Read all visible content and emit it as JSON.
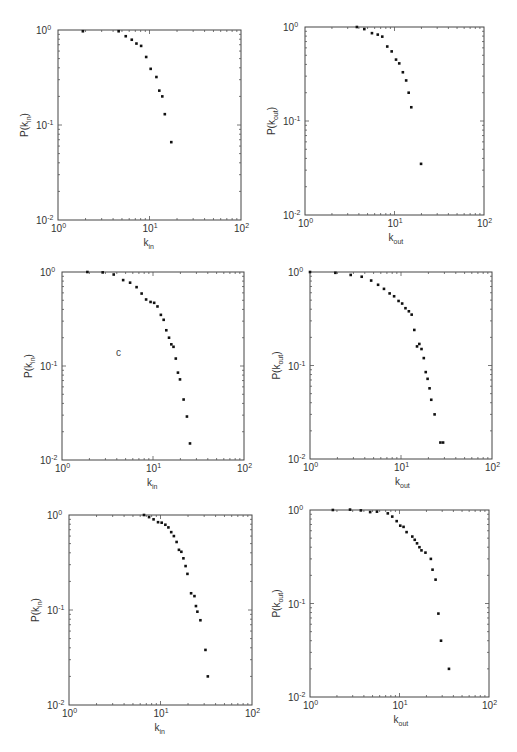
{
  "chart_data": [
    {
      "type": "scatter",
      "panel": "top-left",
      "xlabel": "k_in",
      "ylabel": "P(k_in)",
      "xscale": "log",
      "yscale": "log",
      "xlim": [
        1,
        100
      ],
      "ylim": [
        0.01,
        1
      ],
      "xticklabels": [
        "10^0",
        "10^1",
        "10^2"
      ],
      "yticklabels": [
        "10^-2",
        "10^-1",
        "10^0"
      ],
      "grid": false,
      "x": [
        1.87,
        4.6,
        5.5,
        6.4,
        7.2,
        8.1,
        9.2,
        10.3,
        11.9,
        12.8,
        13.8,
        14.7,
        17.3
      ],
      "y": [
        0.97,
        0.97,
        0.86,
        0.79,
        0.72,
        0.68,
        0.52,
        0.39,
        0.32,
        0.23,
        0.2,
        0.13,
        0.066
      ]
    },
    {
      "type": "scatter",
      "panel": "top-right",
      "xlabel": "k_out",
      "ylabel": "P(k_out)",
      "xscale": "log",
      "yscale": "log",
      "xlim": [
        1,
        100
      ],
      "ylim": [
        0.01,
        1
      ],
      "xticklabels": [
        "10^0",
        "10^1",
        "10^2"
      ],
      "yticklabels": [
        "10^-2",
        "10^-1",
        "10^0"
      ],
      "grid": false,
      "x": [
        3.8,
        4.6,
        5.6,
        6.5,
        7.3,
        8.3,
        9.3,
        10.4,
        11.3,
        12.4,
        13.5,
        14.4,
        15.4,
        19.8
      ],
      "y": [
        1.0,
        0.95,
        0.86,
        0.83,
        0.79,
        0.62,
        0.55,
        0.45,
        0.41,
        0.33,
        0.27,
        0.2,
        0.14,
        0.035
      ]
    },
    {
      "type": "scatter",
      "panel": "middle-left",
      "xlabel": "k_in",
      "ylabel": "P(k_in)",
      "xscale": "log",
      "yscale": "log",
      "xlim": [
        1,
        100
      ],
      "ylim": [
        0.01,
        1
      ],
      "xticklabels": [
        "10^0",
        "10^1",
        "10^2"
      ],
      "yticklabels": [
        "10^-2",
        "10^-1",
        "10^0"
      ],
      "grid": false,
      "annotation": "c",
      "x": [
        1.9,
        2.8,
        3.7,
        4.7,
        5.6,
        6.6,
        7.5,
        8.4,
        9.4,
        10.3,
        11.2,
        12.2,
        13.1,
        14.0,
        15.0,
        15.9,
        16.8,
        17.8,
        18.8,
        19.8,
        21.7,
        23.6,
        25.5
      ],
      "y": [
        1.0,
        0.99,
        0.94,
        0.82,
        0.77,
        0.69,
        0.59,
        0.51,
        0.48,
        0.47,
        0.43,
        0.35,
        0.31,
        0.24,
        0.2,
        0.17,
        0.16,
        0.12,
        0.085,
        0.072,
        0.044,
        0.029,
        0.015
      ]
    },
    {
      "type": "scatter",
      "panel": "middle-right",
      "xlabel": "k_out",
      "ylabel": "P(k_out)",
      "xscale": "log",
      "yscale": "log",
      "xlim": [
        1,
        100
      ],
      "ylim": [
        0.01,
        1
      ],
      "xticklabels": [
        "10^0",
        "10^1",
        "10^2"
      ],
      "yticklabels": [
        "10^-2",
        "10^-1",
        "10^0"
      ],
      "grid": false,
      "x": [
        1.0,
        1.9,
        2.8,
        3.7,
        4.7,
        5.6,
        6.5,
        7.5,
        8.4,
        9.4,
        10.3,
        11.2,
        12.2,
        13.1,
        14.0,
        15.0,
        15.9,
        16.8,
        17.8,
        18.7,
        19.6,
        20.6,
        21.5,
        23.4,
        27.1,
        29.0
      ],
      "y": [
        1.0,
        0.98,
        0.93,
        0.89,
        0.81,
        0.73,
        0.66,
        0.59,
        0.55,
        0.49,
        0.46,
        0.41,
        0.38,
        0.35,
        0.24,
        0.16,
        0.17,
        0.15,
        0.12,
        0.085,
        0.072,
        0.057,
        0.043,
        0.03,
        0.015,
        0.015
      ]
    },
    {
      "type": "scatter",
      "panel": "bottom-left",
      "xlabel": "k_in",
      "ylabel": "P(k_in)",
      "xscale": "log",
      "yscale": "log",
      "xlim": [
        1,
        100
      ],
      "ylim": [
        0.01,
        1
      ],
      "xticklabels": [
        "10^0",
        "10^1",
        "10^2"
      ],
      "yticklabels": [
        "10^-2",
        "10^-1",
        "10^0"
      ],
      "grid": false,
      "x": [
        6.6,
        7.5,
        8.4,
        9.4,
        10.3,
        11.3,
        12.2,
        13.1,
        14.0,
        15.0,
        15.9,
        16.9,
        17.8,
        18.8,
        19.7,
        21.6,
        23.5,
        24.4,
        25.3,
        27.3,
        31.0,
        32.9
      ],
      "y": [
        1.0,
        0.95,
        0.9,
        0.84,
        0.83,
        0.79,
        0.74,
        0.66,
        0.6,
        0.52,
        0.43,
        0.41,
        0.35,
        0.29,
        0.24,
        0.15,
        0.14,
        0.11,
        0.096,
        0.078,
        0.038,
        0.02
      ]
    },
    {
      "type": "scatter",
      "panel": "bottom-right",
      "xlabel": "k_out",
      "ylabel": "P(k_out)",
      "xscale": "log",
      "yscale": "log",
      "xlim": [
        1,
        100
      ],
      "ylim": [
        0.01,
        1
      ],
      "xticklabels": [
        "10^0",
        "10^1",
        "10^2"
      ],
      "yticklabels": [
        "10^-2",
        "10^-1",
        "10^0"
      ],
      "grid": false,
      "x": [
        1.8,
        2.8,
        3.7,
        4.7,
        5.6,
        7.4,
        8.3,
        9.3,
        10.2,
        11.1,
        12.0,
        13.9,
        14.8,
        15.7,
        16.7,
        17.6,
        19.5,
        22.4,
        23.4,
        25.3,
        27.2,
        29.1,
        35.7
      ],
      "y": [
        1.0,
        1.01,
        0.99,
        0.95,
        0.96,
        0.92,
        0.85,
        0.76,
        0.68,
        0.66,
        0.58,
        0.52,
        0.48,
        0.44,
        0.4,
        0.37,
        0.35,
        0.3,
        0.23,
        0.18,
        0.078,
        0.04,
        0.02
      ]
    }
  ],
  "panels": [
    {
      "x0": 58,
      "y0": 30,
      "x1": 241,
      "y1": 220,
      "xlabel_main": "k",
      "xlabel_sub": "in",
      "ylabel_main": "P(k",
      "ylabel_sub": "in",
      "ylabel_end": ")"
    },
    {
      "x0": 305,
      "y0": 27,
      "x1": 484,
      "y1": 215,
      "xlabel_main": "k",
      "xlabel_sub": "out",
      "ylabel_main": "P(k",
      "ylabel_sub": "out",
      "ylabel_end": ")"
    },
    {
      "x0": 62,
      "y0": 272,
      "x1": 244,
      "y1": 460,
      "xlabel_main": "k",
      "xlabel_sub": "in",
      "ylabel_main": "P(k",
      "ylabel_sub": "in",
      "ylabel_end": ")"
    },
    {
      "x0": 310,
      "y0": 272,
      "x1": 492,
      "y1": 459,
      "xlabel_main": "k",
      "xlabel_sub": "out",
      "ylabel_main": "P(k",
      "ylabel_sub": "out",
      "ylabel_end": ")"
    },
    {
      "x0": 69,
      "y0": 515,
      "x1": 252,
      "y1": 705,
      "xlabel_main": "k",
      "xlabel_sub": "in",
      "ylabel_main": "P(k",
      "ylabel_sub": "in",
      "ylabel_end": ")"
    },
    {
      "x0": 310,
      "y0": 510,
      "x1": 489,
      "y1": 697,
      "xlabel_main": "k",
      "xlabel_sub": "out",
      "ylabel_main": "P(k",
      "ylabel_sub": "out",
      "ylabel_end": ")"
    }
  ],
  "annotation": {
    "panel": 2,
    "text": "c",
    "x": 116,
    "y": 356
  },
  "tick_base": "10",
  "xtick_exps": [
    "0",
    "1",
    "2"
  ],
  "ytick_exps": [
    "-2",
    "-1",
    "0"
  ]
}
